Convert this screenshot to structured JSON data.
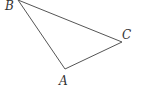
{
  "diagram": {
    "type": "triangle",
    "vertices": [
      {
        "label": "A",
        "x": 65,
        "y": 69,
        "label_x": 59,
        "label_y": 85
      },
      {
        "label": "B",
        "x": 18,
        "y": 0,
        "label_x": 5,
        "label_y": 9
      },
      {
        "label": "C",
        "x": 122,
        "y": 42,
        "label_x": 122,
        "label_y": 38
      }
    ],
    "edges": [
      [
        "B",
        "C"
      ],
      [
        "C",
        "A"
      ],
      [
        "A",
        "B"
      ]
    ],
    "colors": {
      "line": "#555555",
      "text": "#333333",
      "background": "#ffffff"
    }
  }
}
